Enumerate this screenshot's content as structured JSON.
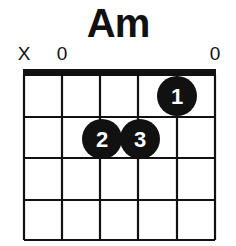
{
  "chord": {
    "name": "Am",
    "string_markers": [
      {
        "string": 6,
        "label": "X",
        "meaning": "muted"
      },
      {
        "string": 5,
        "label": "0",
        "meaning": "open"
      },
      {
        "string": 4,
        "label": "",
        "meaning": "fretted"
      },
      {
        "string": 3,
        "label": "",
        "meaning": "fretted"
      },
      {
        "string": 2,
        "label": "",
        "meaning": "fretted"
      },
      {
        "string": 1,
        "label": "0",
        "meaning": "open"
      }
    ],
    "fingers": [
      {
        "finger": "1",
        "string": 2,
        "fret": 1
      },
      {
        "finger": "2",
        "string": 4,
        "fret": 2
      },
      {
        "finger": "3",
        "string": 3,
        "fret": 2
      }
    ],
    "frets_shown": 4,
    "strings": 6
  },
  "colors": {
    "ink": "#111111",
    "background": "#ffffff",
    "finger_text": "#ffffff"
  }
}
